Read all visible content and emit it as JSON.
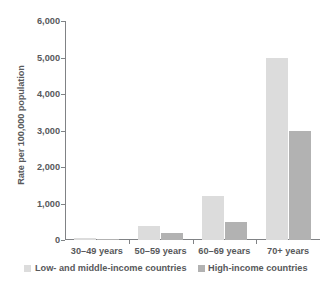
{
  "chart_data": {
    "type": "bar",
    "title": "",
    "subtitle": "",
    "xlabel": "",
    "ylabel": "Rate per 100,000 population",
    "categories": [
      "30–49 years",
      "50–59 years",
      "60–69 years",
      "70+ years"
    ],
    "series": [
      {
        "name": "Low- and middle-income countries",
        "color": "#dcdcdc",
        "values": [
          60,
          380,
          1200,
          5000
        ]
      },
      {
        "name": "High-income countries",
        "color": "#b2b2b2",
        "values": [
          40,
          200,
          480,
          3000
        ]
      }
    ],
    "ylim": [
      0,
      6000
    ],
    "yticks": [
      0,
      1000,
      2000,
      3000,
      4000,
      5000,
      6000
    ],
    "ytick_labels": [
      "0",
      "1,000",
      "2,000",
      "3,000",
      "4,000",
      "5,000",
      "6,000"
    ],
    "grid": false,
    "legend_position": "bottom"
  },
  "axes": {
    "axis_color": "#808285",
    "text_color": "#58595b",
    "background": "#ffffff"
  }
}
